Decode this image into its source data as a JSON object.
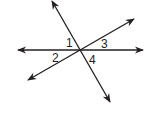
{
  "diagram": {
    "type": "intersecting-lines",
    "color": "#231f20",
    "intersection": {
      "x": 80,
      "y": 50
    },
    "lines": [
      {
        "name": "horizontal-line",
        "x1": 18,
        "y1": 50,
        "x2": 143,
        "y2": 50
      },
      {
        "name": "steep-line",
        "x1": 52,
        "y1": 1,
        "x2": 110,
        "y2": 102
      },
      {
        "name": "oblique-line",
        "x1": 28,
        "y1": 80,
        "x2": 134,
        "y2": 19
      }
    ],
    "angle_labels": [
      {
        "text": "1",
        "x": 66,
        "y": 47
      },
      {
        "text": "3",
        "x": 101,
        "y": 48
      },
      {
        "text": "2",
        "x": 52,
        "y": 62
      },
      {
        "text": "4",
        "x": 89,
        "y": 64
      }
    ]
  }
}
